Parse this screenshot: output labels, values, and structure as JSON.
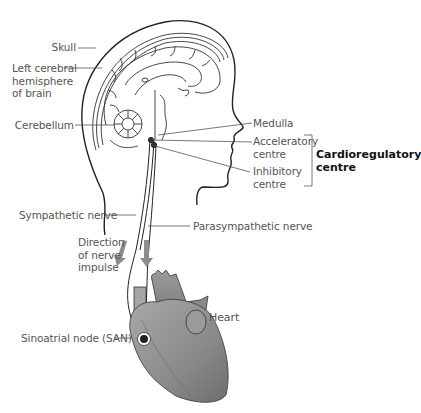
{
  "diagram": {
    "labels": {
      "skull": "Skull",
      "left_hemisphere": [
        "Left cerebral",
        "hemisphere",
        "of brain"
      ],
      "cerebellum": "Cerebellum",
      "medulla": "Medulla",
      "acceleratory": [
        "Acceleratory",
        "centre"
      ],
      "inhibitory": [
        "Inhibitory",
        "centre"
      ],
      "cardioregulatory": [
        "Cardioregulatory",
        "centre"
      ],
      "sympathetic": "Sympathetic nerve",
      "parasympathetic": "Parasympathetic nerve",
      "direction": [
        "Direction",
        "of nerve",
        "impulse"
      ],
      "heart": "Heart",
      "san": "Sinoatrial node (SAN)"
    },
    "colors": {
      "line": "#222222",
      "label_text": "#555555",
      "heart_fill": "#8a8a8a",
      "arrow": "#8c8c8c"
    }
  }
}
